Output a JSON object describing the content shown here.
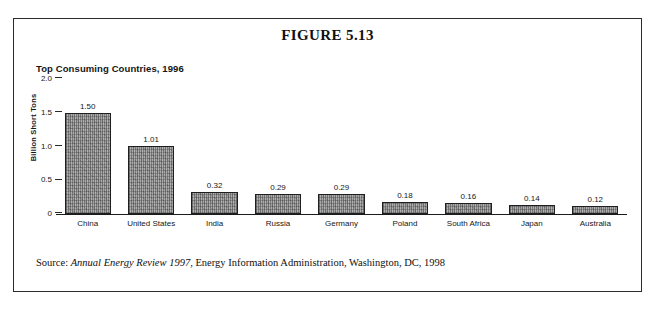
{
  "figure": {
    "title": "FIGURE 5.13",
    "subtitle": "Top Consuming Countries, 1996",
    "source_prefix": "Source: ",
    "source_italic": "Annual Energy Review 1997",
    "source_rest": ", Energy Information Administration, Washington, DC, 1998"
  },
  "colors": {
    "frame": "#2b2b2b",
    "bar_fill": "#9d9d9d",
    "bar_edge": "#1f1f1f",
    "text": "#161616"
  },
  "chart_data": {
    "type": "bar",
    "title": "Top Consuming Countries, 1996",
    "xlabel": "",
    "ylabel": "Billion Short Tons",
    "categories": [
      "China",
      "United States",
      "India",
      "Russia",
      "Germany",
      "Poland",
      "South Africa",
      "Japan",
      "Australia"
    ],
    "values": [
      1.5,
      1.01,
      0.32,
      0.29,
      0.29,
      0.18,
      0.16,
      0.14,
      0.12
    ],
    "value_labels": [
      "1.50",
      "1.01",
      "0.32",
      "0.29",
      "0.29",
      "0.18",
      "0.16",
      "0.14",
      "0.12"
    ],
    "ylim": [
      0,
      2.0
    ],
    "yticks": [
      0,
      0.5,
      1.0,
      1.5,
      2.0
    ],
    "ytick_labels": [
      "0",
      "0.5",
      "1.0",
      "1.5",
      "2.0"
    ],
    "grid": false,
    "legend": false
  }
}
